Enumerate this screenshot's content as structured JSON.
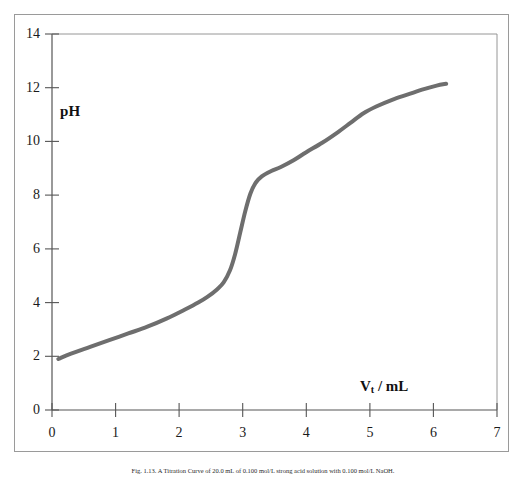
{
  "figure": {
    "caption": "Fig. 1.13. A Titration Curve of 20.0 mL of 0.100 mol/L strong acid solution with 0.100 mol/L NaOH."
  },
  "chart_data": {
    "type": "line",
    "title": "",
    "subtitle": "",
    "xlabel": "V_t / mL",
    "xlabel_text": "V",
    "xlabel_sub": "t",
    "xlabel_rest": " / mL",
    "ylabel": "pH",
    "xlim": [
      0,
      7
    ],
    "ylim": [
      0,
      14
    ],
    "xticks": [
      0,
      1,
      2,
      3,
      4,
      5,
      6,
      7
    ],
    "yticks": [
      0,
      2,
      4,
      6,
      8,
      10,
      12,
      14
    ],
    "xtick_labels": [
      "0",
      "1",
      "2",
      "3",
      "4",
      "5",
      "6",
      "7"
    ],
    "ytick_labels": [
      "0",
      "2",
      "4",
      "6",
      "8",
      "10",
      "12",
      "14"
    ],
    "grid": false,
    "legend": false,
    "legend_position": "none",
    "series": [
      {
        "name": "titration curve",
        "color": "#6e6e6e",
        "line_width": 4,
        "x": [
          0.1,
          0.3,
          0.6,
          0.9,
          1.2,
          1.5,
          1.8,
          2.1,
          2.3,
          2.45,
          2.6,
          2.7,
          2.8,
          2.88,
          2.96,
          3.04,
          3.12,
          3.2,
          3.3,
          3.45,
          3.6,
          3.8,
          4.0,
          4.25,
          4.5,
          4.7,
          4.9,
          5.1,
          5.35,
          5.6,
          5.85,
          6.05,
          6.2
        ],
        "y": [
          1.9,
          2.1,
          2.35,
          2.6,
          2.85,
          3.1,
          3.4,
          3.75,
          4.0,
          4.22,
          4.5,
          4.75,
          5.2,
          5.8,
          6.6,
          7.4,
          8.05,
          8.45,
          8.7,
          8.9,
          9.05,
          9.3,
          9.6,
          9.95,
          10.35,
          10.7,
          11.05,
          11.3,
          11.55,
          11.75,
          11.95,
          12.08,
          12.15
        ]
      }
    ],
    "annotations": []
  },
  "colors": {
    "curve": "#6e6e6e",
    "axis": "#555555",
    "frame": "#9a9a9a",
    "text": "#1a1a1a",
    "background": "#ffffff"
  }
}
